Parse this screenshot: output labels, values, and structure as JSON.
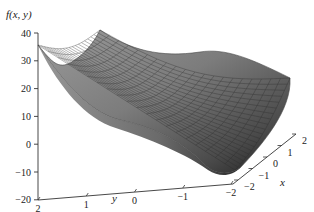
{
  "chart_data": {
    "type": "surface3d",
    "title": "",
    "zlabel": "f(x, y)",
    "xlabel": "x",
    "ylabel": "y",
    "z_ticks": [
      "40",
      "30",
      "20",
      "10",
      "0",
      "−10",
      "−20"
    ],
    "zlim": [
      -20,
      40
    ],
    "y_ticks": [
      "2",
      "1",
      "0",
      "−1",
      "−2"
    ],
    "ylim": [
      -2,
      2
    ],
    "x_ticks": [
      "−2",
      "−1",
      "0",
      "1",
      "2"
    ],
    "xlim": [
      -2,
      2
    ],
    "grid": false,
    "surface": {
      "description": "Saddle-like wireframe shaded surface; high along y=2 edge (~35 at x=-2, ~40 at x=2), sagging in middle, drops to minimum near y=-2, x=-2 (~-15), rises to ~25 at y=-2, x=2",
      "corner_values": {
        "x=-2,y=2": 35,
        "x=2,y=2": 40,
        "x=-2,y=-2": -15,
        "x=2,y=-2": 25
      },
      "mesh": "20x20",
      "color": "#6e6e6e"
    }
  }
}
